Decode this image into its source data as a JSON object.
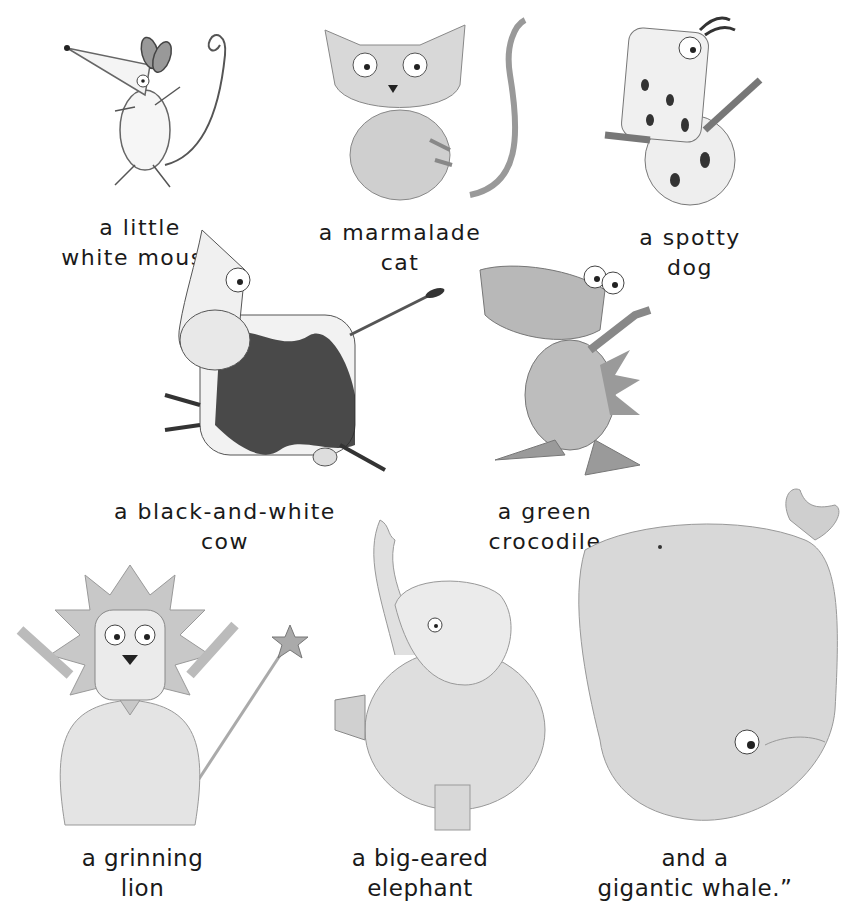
{
  "page": {
    "background": "#ffffff",
    "text_color": "#1a1a1a"
  },
  "animals": [
    {
      "id": "mouse",
      "icon": "mouse-illustration",
      "caption": [
        "a little",
        "white mouse"
      ]
    },
    {
      "id": "cat",
      "icon": "cat-illustration",
      "caption": [
        "a marmalade",
        "cat"
      ]
    },
    {
      "id": "dog",
      "icon": "dog-illustration",
      "caption": [
        "a spotty",
        "dog"
      ]
    },
    {
      "id": "cow",
      "icon": "cow-illustration",
      "caption": [
        "a black-and-white",
        "cow"
      ]
    },
    {
      "id": "crocodile",
      "icon": "crocodile-illustration",
      "caption": [
        "a green",
        "crocodile"
      ]
    },
    {
      "id": "lion",
      "icon": "lion-illustration",
      "caption": [
        "a grinning",
        "lion"
      ]
    },
    {
      "id": "elephant",
      "icon": "elephant-illustration",
      "caption": [
        "a big-eared",
        "elephant"
      ]
    },
    {
      "id": "whale",
      "icon": "whale-illustration",
      "caption": [
        "and a",
        "gigantic whale.”"
      ]
    }
  ]
}
